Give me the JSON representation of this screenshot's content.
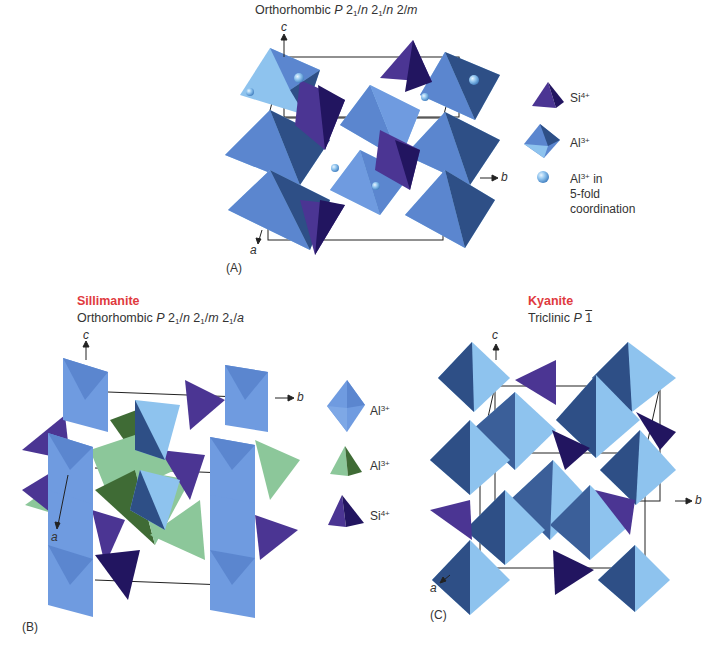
{
  "panels": [
    {
      "id": "A",
      "label": "(A)",
      "mineral": "",
      "title_prefix": "Orthorhombic ",
      "space_group": [
        "P",
        " 2",
        "1",
        "/",
        "n",
        " 2",
        "1",
        "/",
        "n",
        " 2/",
        "m"
      ],
      "axes": {
        "a": "a",
        "b": "b",
        "c": "c"
      },
      "legend": [
        {
          "shape": "tetrahedron",
          "color": "#3b2a7e",
          "label": "Si",
          "charge": "4+"
        },
        {
          "shape": "octahedron",
          "color": "#5b86cf",
          "label": "Al",
          "charge": "3+"
        },
        {
          "shape": "sphere",
          "color": "#8ec3ee",
          "label": "Al",
          "charge": "3+",
          "suffix": " in",
          "lines": [
            "5-fold",
            "coordination"
          ]
        }
      ]
    },
    {
      "id": "B",
      "label": "(B)",
      "mineral": "Sillimanite",
      "title_prefix": "Orthorhombic ",
      "space_group": [
        "P",
        " 2",
        "1",
        "/",
        "n",
        " 2",
        "1",
        "/",
        "m",
        " 2",
        "1",
        "/",
        "a"
      ],
      "axes": {
        "a": "a",
        "b": "b",
        "c": "c"
      },
      "legend": [
        {
          "shape": "octahedron",
          "color": "#6f9be0",
          "label": "Al",
          "charge": "3+"
        },
        {
          "shape": "tetrahedron",
          "color": "#7fbf8f",
          "label": "Al",
          "charge": "3+"
        },
        {
          "shape": "tetrahedron",
          "color": "#3b2a7e",
          "label": "Si",
          "charge": "4+"
        }
      ]
    },
    {
      "id": "C",
      "label": "(C)",
      "mineral": "Kyanite",
      "title_prefix": "Triclinic ",
      "space_group": [
        "P",
        "1"
      ],
      "axes": {
        "a": "a",
        "b": "b",
        "c": "c"
      }
    }
  ],
  "colors": {
    "mineral_name": "#e03a3e",
    "al_octahedron_light": "#8ec3ee",
    "al_octahedron_mid": "#5b86cf",
    "al_octahedron_dark": "#2e4f86",
    "si_tetrahedron_light": "#4b3593",
    "si_tetrahedron_dark": "#221560",
    "al_tetrahedron_light": "#8cc79a",
    "al_tetrahedron_dark": "#3f6b35",
    "cell_edge": "#222222"
  }
}
